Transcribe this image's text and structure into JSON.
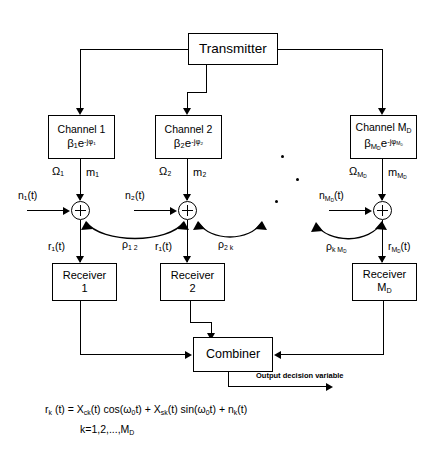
{
  "diagram": {
    "transmitter": {
      "label": "Transmitter"
    },
    "channels": [
      {
        "name": "Channel 1",
        "gain": "β₁e",
        "phase": "-jφ₁",
        "omega": "Ω₁",
        "m": "m₁"
      },
      {
        "name": "Channel 2",
        "gain": "β₂e",
        "phase": "-jφ₂",
        "omega": "Ω₂",
        "m": "m₂"
      },
      {
        "name": "Channel M",
        "name_sub": "D",
        "gain": "β",
        "gain_sub": "M",
        "gain_sub2": "D",
        "phase": "-jφ",
        "omega": "Ω",
        "m": "m"
      }
    ],
    "noise": [
      {
        "label": "n₁(t)"
      },
      {
        "label": "n₂(t)"
      },
      {
        "label": "n",
        "sub": "M",
        "sub2": "D",
        "tail": "(t)"
      }
    ],
    "adder_outputs": [
      {
        "label": "r₁(t)"
      },
      {
        "label": "r₁(t)"
      },
      {
        "label": "r",
        "sub": "M",
        "sub2": "D",
        "tail": "(t)"
      }
    ],
    "correlations": [
      {
        "label": "ρ",
        "sub": "1 2"
      },
      {
        "label": "ρ",
        "sub": "2 k"
      },
      {
        "label": "ρ",
        "sub": "k M",
        "sub2": "D"
      }
    ],
    "receivers": [
      {
        "line1": "Receiver",
        "line2": "1"
      },
      {
        "line1": "Receiver",
        "line2": "2"
      },
      {
        "line1": "Receiver",
        "line2": "M",
        "line2_sub": "D"
      }
    ],
    "combiner": {
      "label": "Combiner"
    },
    "output_note": "Output decision variable",
    "formula": {
      "line1_a": "r",
      "line1_a_sub": "k",
      "line1_b": " (t) = X",
      "line1_b_sub": "ck",
      "line1_c": "(t) cos(ω",
      "line1_c_sub": "0",
      "line1_d": "t) + X",
      "line1_d_sub": "sk",
      "line1_e": "(t) sin(ω",
      "line1_e_sub": "0",
      "line1_f": "t) + n",
      "line1_f_sub": "k",
      "line1_g": "(t)",
      "line2": "k=1,2,...,M",
      "line2_sub": "D"
    },
    "colors": {
      "stroke": "#000000",
      "background": "#ffffff"
    }
  }
}
